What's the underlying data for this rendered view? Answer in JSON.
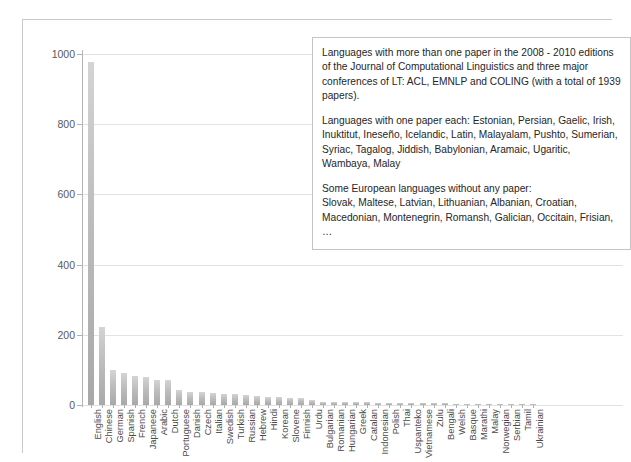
{
  "chart_data": {
    "type": "bar",
    "title": "",
    "xlabel": "",
    "ylabel": "",
    "ylim": [
      0,
      1000
    ],
    "yticks": [
      0,
      200,
      400,
      600,
      800,
      1000
    ],
    "ytick_labels": [
      "0",
      "200",
      "400",
      "600",
      "800",
      "1000"
    ],
    "grid": true,
    "legend": "none",
    "bar_color": "#bdbdbd",
    "categories": [
      "English",
      "Chinese",
      "German",
      "Spanish",
      "French",
      "Japanese",
      "Arabic",
      "Dutch",
      "Portuguese",
      "Danish",
      "Czech",
      "Italian",
      "Swedish",
      "Turkish",
      "Russian",
      "Hebrew",
      "Hindi",
      "Korean",
      "Slovene",
      "Finnish",
      "Urdu",
      "Bulgarian",
      "Romanian",
      "Hungarian",
      "Greek",
      "Catalan",
      "Indonesian",
      "Polish",
      "Thai",
      "Uspanteko",
      "Vietnamese",
      "Zulu",
      "Bengali",
      "Welsh",
      "Basque",
      "Marathi",
      "Malay",
      "Norwegian",
      "Serbian",
      "Tamil",
      "Ukrainian"
    ],
    "values": [
      977,
      222,
      100,
      92,
      84,
      80,
      72,
      70,
      44,
      38,
      36,
      34,
      31,
      30,
      28,
      26,
      24,
      22,
      20,
      19,
      14,
      10,
      9,
      9,
      8,
      8,
      7,
      7,
      6,
      6,
      6,
      5,
      5,
      4,
      4,
      4,
      3,
      3,
      3,
      2,
      2
    ]
  },
  "annotation": {
    "paragraph_1": "Languages with more than one paper in the 2008 - 2010 editions of the Journal of Computational Linguistics and three major conferences of LT: ACL, EMNLP and COLING (with a total of 1939 papers).",
    "paragraph_2": "Languages with one paper each: Estonian, Persian, Gaelic, Irish, Inuktitut, Ineseño, Icelandic, Latin, Malayalam, Pushto, Sumerian, Syriac, Tagalog, Jiddish, Babylonian, Aramaic, Ugaritic, Wambaya, Malay",
    "paragraph_3": "Some European languages without any paper:\nSlovak, Maltese, Latvian, Lithuanian, Albanian, Croatian, Macedonian,  Montenegrin, Romansh, Galician, Occitain, Frisian, …"
  }
}
